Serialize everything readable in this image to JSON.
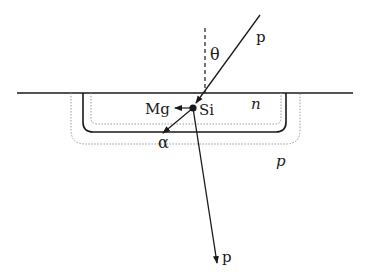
{
  "diagram": {
    "type": "physics-schematic",
    "labels": {
      "incident_particle": "p",
      "angle": "θ",
      "target_nucleus": "Si",
      "recoil_nucleus": "Mg",
      "emitted_particle": "α",
      "n_region": "n",
      "p_region": "p",
      "outgoing_particle": "p"
    },
    "colors": {
      "line": "#1a1a1a",
      "dotted": "#9a9a9a",
      "background": "#ffffff"
    }
  }
}
